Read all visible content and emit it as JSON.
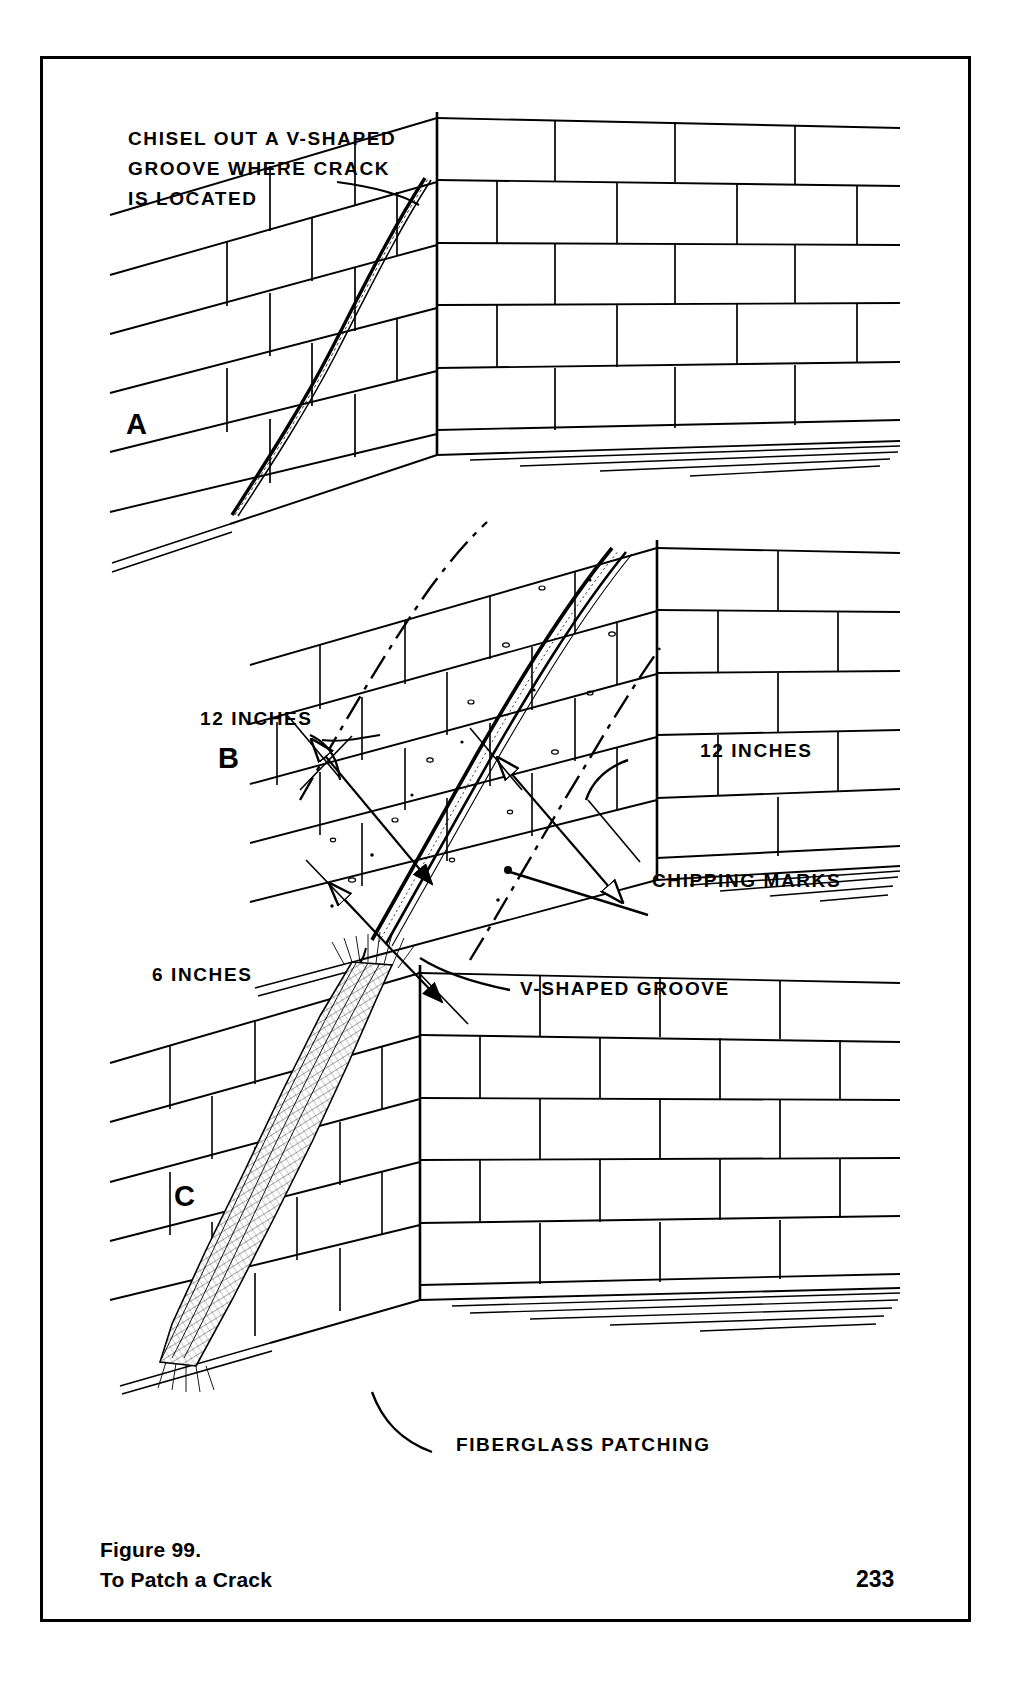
{
  "figure": {
    "caption_line1": "Figure 99.",
    "caption_line2": "To Patch a Crack",
    "page_number": "233"
  },
  "panels": [
    {
      "letter": "A",
      "annotations": [
        "CHISEL OUT A V-SHAPED",
        "GROOVE WHERE CRACK",
        "IS LOCATED"
      ]
    },
    {
      "letter": "B",
      "annotations": [
        "12 INCHES",
        "12 INCHES",
        "6 INCHES",
        "CHIPPING MARKS",
        "V-SHAPED GROOVE"
      ]
    },
    {
      "letter": "C",
      "annotations": [
        "FIBERGLASS PATCHING"
      ]
    }
  ],
  "labels": {
    "a_line1": "CHISEL OUT A V-SHAPED",
    "a_line2": "GROOVE WHERE CRACK",
    "a_line3": "IS LOCATED",
    "b_inches_left": "12 INCHES",
    "b_inches_right": "12 INCHES",
    "b_inches_bottom": "6 INCHES",
    "b_chipping": "CHIPPING MARKS",
    "b_groove": "V-SHAPED GROOVE",
    "c_fiberglass": "FIBERGLASS  PATCHING",
    "letter_a": "A",
    "letter_b": "B",
    "letter_c": "C"
  },
  "colors": {
    "ink": "#000000",
    "paper": "#ffffff"
  }
}
